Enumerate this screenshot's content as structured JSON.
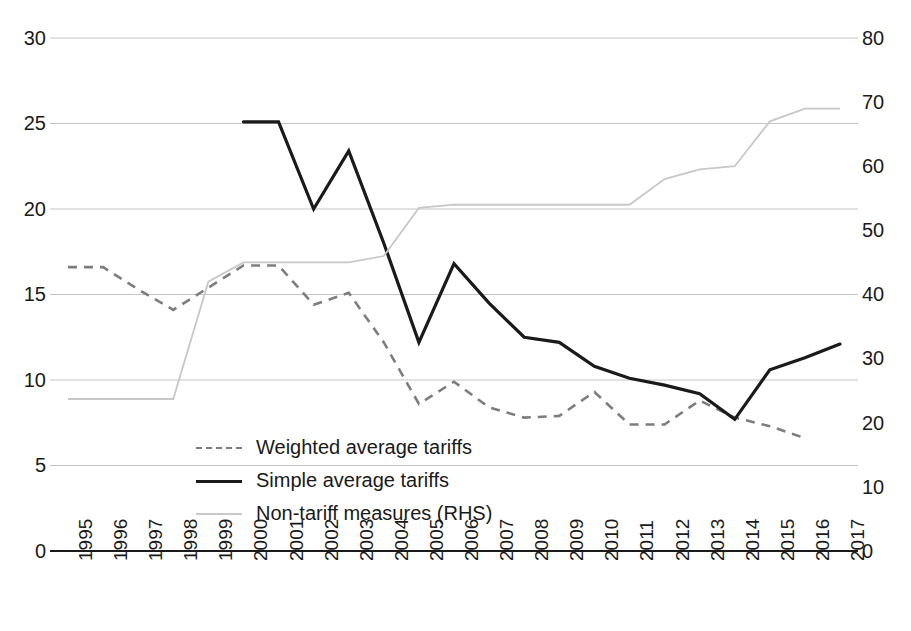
{
  "chart_data": {
    "type": "line",
    "title": "",
    "subtitle": "",
    "xlabel": "",
    "ylabel": "",
    "y2label": "",
    "x": [
      "1995",
      "1996",
      "1997",
      "1998",
      "1999",
      "2000",
      "2001",
      "2002",
      "2003",
      "2004",
      "2005",
      "2006",
      "2007",
      "2008",
      "2009",
      "2010",
      "2011",
      "2012",
      "2013",
      "2014",
      "2015",
      "2016",
      "2017"
    ],
    "ylim": [
      0,
      30
    ],
    "yticks": [
      "0",
      "5",
      "10",
      "15",
      "20",
      "25",
      "30"
    ],
    "y2lim": [
      0,
      80
    ],
    "y2ticks": [
      "0",
      "10",
      "20",
      "30",
      "40",
      "50",
      "60",
      "70",
      "80"
    ],
    "grid": true,
    "legend_position": "inside-lower-left",
    "series": [
      {
        "name": "Weighted average tariffs",
        "axis": "left",
        "style": "dashed",
        "color": "#7d7d7d",
        "values": [
          16.6,
          16.6,
          15.3,
          14.1,
          15.4,
          16.7,
          16.7,
          14.4,
          15.1,
          12.2,
          8.6,
          9.9,
          8.4,
          7.8,
          7.9,
          9.3,
          7.4,
          7.4,
          8.8,
          7.8,
          7.3,
          6.6,
          null
        ]
      },
      {
        "name": "Simple average tariffs",
        "axis": "left",
        "style": "solid",
        "color": "#1a1a1a",
        "values": [
          null,
          null,
          null,
          null,
          null,
          25.1,
          25.1,
          20.0,
          23.4,
          18.0,
          12.2,
          16.8,
          14.5,
          12.5,
          12.2,
          10.8,
          10.1,
          9.7,
          9.2,
          7.7,
          10.6,
          11.3,
          12.1
        ]
      },
      {
        "name": "Non-tariff measures (RHS)",
        "axis": "right",
        "style": "solid-light",
        "color": "#c8c8c8",
        "values": [
          23.7,
          23.7,
          23.7,
          23.7,
          42.0,
          45.0,
          45.0,
          45.0,
          45.0,
          46.0,
          53.5,
          54.0,
          54.0,
          54.0,
          54.0,
          54.0,
          54.0,
          58.0,
          59.5,
          60.0,
          67.0,
          69.0,
          69.0
        ]
      }
    ]
  },
  "axes": {
    "left_ticks": [
      "30",
      "25",
      "20",
      "15",
      "10",
      "5",
      "0"
    ],
    "right_ticks": [
      "80",
      "70",
      "60",
      "50",
      "40",
      "30",
      "20",
      "10",
      "0"
    ],
    "x_ticks": [
      "1995",
      "1996",
      "1997",
      "1998",
      "1999",
      "2000",
      "2001",
      "2002",
      "2003",
      "2004",
      "2005",
      "2006",
      "2007",
      "2008",
      "2009",
      "2010",
      "2011",
      "2012",
      "2013",
      "2014",
      "2015",
      "2016",
      "2017"
    ]
  },
  "legend": {
    "items": [
      {
        "label": "Weighted average tariffs",
        "style": "dashed",
        "color": "#7d7d7d"
      },
      {
        "label": "Simple average tariffs",
        "style": "solid",
        "color": "#1a1a1a"
      },
      {
        "label": "Non-tariff measures (RHS)",
        "style": "solid-light",
        "color": "#c9c9c9"
      }
    ]
  },
  "colors": {
    "background": "#ffffff",
    "gridline": "#c4c4c4",
    "axis": "#1a1a1a",
    "weighted": "#7d7d7d",
    "simple": "#1a1a1a",
    "ntm": "#c9c9c9"
  }
}
